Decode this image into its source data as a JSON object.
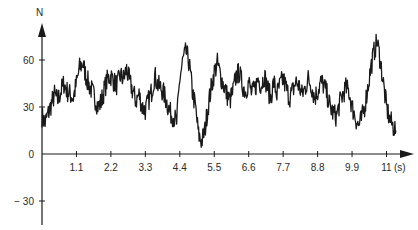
{
  "chart_data": {
    "type": "line",
    "title": "",
    "xlabel": "(s)",
    "ylabel": "N",
    "x_tick_labels": [
      "1.1",
      "2.2",
      "3.3",
      "4.4",
      "5.5",
      "6.6",
      "7.7",
      "8.8",
      "9.9",
      "11"
    ],
    "x_ticks": [
      1.1,
      2.2,
      3.3,
      4.4,
      5.5,
      6.6,
      7.7,
      8.8,
      9.9,
      11
    ],
    "y_tick_labels": [
      "60",
      "30",
      "0",
      "− 30"
    ],
    "y_ticks": [
      60,
      30,
      0,
      -30
    ],
    "xlim": [
      0,
      11.7
    ],
    "ylim": [
      -40,
      80
    ],
    "grid": false,
    "legend": null,
    "series": [
      {
        "name": "N",
        "color": "#1a1a1a",
        "x": [
          0.0,
          0.1,
          0.2,
          0.3,
          0.4,
          0.5,
          0.6,
          0.7,
          0.8,
          0.9,
          1.0,
          1.1,
          1.2,
          1.3,
          1.4,
          1.5,
          1.6,
          1.7,
          1.8,
          1.9,
          2.0,
          2.1,
          2.2,
          2.3,
          2.4,
          2.5,
          2.6,
          2.7,
          2.8,
          2.9,
          3.0,
          3.1,
          3.2,
          3.3,
          3.4,
          3.5,
          3.6,
          3.7,
          3.8,
          3.9,
          4.0,
          4.1,
          4.2,
          4.3,
          4.4,
          4.5,
          4.6,
          4.7,
          4.8,
          4.9,
          5.0,
          5.1,
          5.2,
          5.3,
          5.4,
          5.5,
          5.6,
          5.7,
          5.8,
          5.9,
          6.0,
          6.1,
          6.2,
          6.3,
          6.4,
          6.5,
          6.6,
          6.7,
          6.8,
          6.9,
          7.0,
          7.1,
          7.2,
          7.3,
          7.4,
          7.5,
          7.6,
          7.7,
          7.8,
          7.9,
          8.0,
          8.1,
          8.2,
          8.3,
          8.4,
          8.5,
          8.6,
          8.7,
          8.8,
          8.9,
          9.0,
          9.1,
          9.2,
          9.3,
          9.4,
          9.5,
          9.6,
          9.7,
          9.8,
          9.9,
          10.0,
          10.1,
          10.2,
          10.3,
          10.4,
          10.5,
          10.6,
          10.7,
          10.8,
          10.9,
          11.0,
          11.1,
          11.2,
          11.3
        ],
        "values": [
          24,
          20,
          26,
          32,
          38,
          34,
          40,
          45,
          40,
          38,
          36,
          45,
          55,
          58,
          50,
          44,
          40,
          35,
          30,
          34,
          42,
          48,
          50,
          46,
          44,
          50,
          48,
          54,
          46,
          40,
          34,
          38,
          30,
          28,
          34,
          40,
          50,
          44,
          42,
          38,
          32,
          26,
          24,
          20,
          48,
          60,
          65,
          58,
          40,
          30,
          12,
          8,
          15,
          30,
          42,
          52,
          58,
          50,
          44,
          38,
          34,
          40,
          50,
          52,
          44,
          40,
          46,
          38,
          42,
          48,
          44,
          50,
          42,
          36,
          46,
          38,
          44,
          48,
          42,
          36,
          40,
          46,
          44,
          38,
          42,
          48,
          44,
          36,
          40,
          46,
          44,
          38,
          30,
          26,
          24,
          32,
          38,
          42,
          40,
          30,
          24,
          18,
          22,
          30,
          42,
          55,
          65,
          72,
          60,
          45,
          30,
          22,
          18,
          15
        ]
      }
    ]
  }
}
